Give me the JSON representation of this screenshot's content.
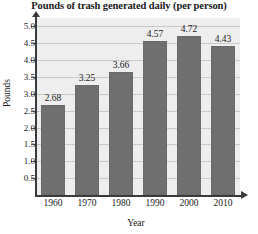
{
  "chart_data": {
    "type": "bar",
    "title": "Pounds of trash generated daily (per person)",
    "xlabel": "Year",
    "ylabel": "Pounds",
    "categories": [
      "1960",
      "1970",
      "1980",
      "1990",
      "2000",
      "2010"
    ],
    "values": [
      2.68,
      3.25,
      3.66,
      4.57,
      4.72,
      4.43
    ],
    "value_labels": [
      "2.68",
      "3.25",
      "3.66",
      "4.57",
      "4.72",
      "4.43"
    ],
    "ylim": [
      0,
      5.25
    ],
    "yticks": [
      0.5,
      1.0,
      1.5,
      2.0,
      2.5,
      3.0,
      3.5,
      4.0,
      4.5,
      5.0
    ],
    "ytick_labels": [
      "5.0",
      "4.5",
      "4.0",
      "3.5",
      "3.0",
      "2.5",
      "2.0",
      "1.5",
      "1.0",
      "0.5"
    ],
    "grid": true,
    "legend": null,
    "colors": {
      "bar_fill": "#6f6f6f",
      "plot_background": "#eeeeee",
      "gridline": "#c9c9c9",
      "axis": "#3a3a3a",
      "text": "#1a1a1a"
    }
  }
}
